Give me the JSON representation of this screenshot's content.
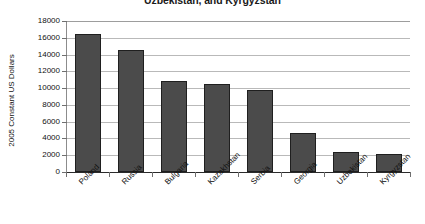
{
  "chart_data": {
    "type": "bar",
    "title": "Uzbekistan, and Kyrgyzstan",
    "xlabel": "",
    "ylabel": "2005 Constant US Dollars",
    "ylim": [
      0,
      18000
    ],
    "ytick_step": 2000,
    "grid": true,
    "legend": null,
    "categories": [
      "Poland",
      "Russia",
      "Bulgaria",
      "Kazakhstan",
      "Serbia",
      "Georgia",
      "Uzbekistan",
      "Kyrgyzstan"
    ],
    "values": [
      16500,
      14600,
      10900,
      10500,
      9800,
      4700,
      2400,
      2100
    ],
    "ytick_labels": [
      "18000",
      "16000",
      "14000",
      "12000",
      "10000",
      "8000",
      "6000",
      "4000",
      "2000",
      "0"
    ],
    "bar_color": "#4b4b4b",
    "bar_edge_color": "#1f1f1f",
    "gridline_color": "#b9b9b9",
    "axis_color": "#2b2b2b",
    "background_color": "#ffffff"
  }
}
